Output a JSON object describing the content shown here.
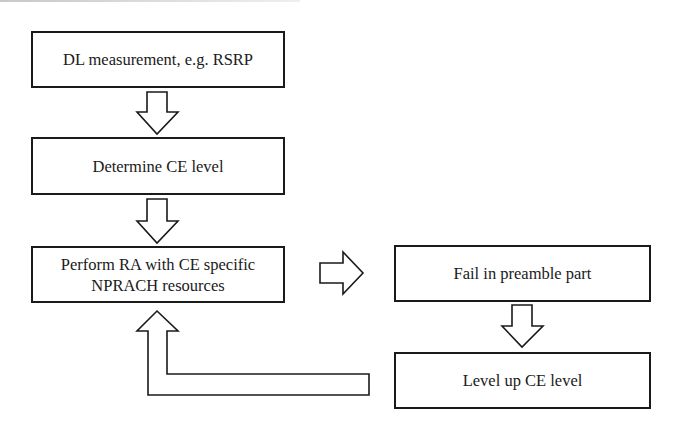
{
  "diagram": {
    "type": "flowchart",
    "nodes": [
      {
        "id": "dl-measurement",
        "label": "DL measurement, e.g. RSRP"
      },
      {
        "id": "determine-ce",
        "label": "Determine CE level"
      },
      {
        "id": "perform-ra",
        "label_line1": "Perform RA with CE specific",
        "label_line2": "NPRACH resources"
      },
      {
        "id": "fail-preamble",
        "label": "Fail in preamble part"
      },
      {
        "id": "level-up",
        "label": "Level up CE level"
      }
    ],
    "edges": [
      {
        "from": "dl-measurement",
        "to": "determine-ce"
      },
      {
        "from": "determine-ce",
        "to": "perform-ra"
      },
      {
        "from": "perform-ra",
        "to": "fail-preamble"
      },
      {
        "from": "fail-preamble",
        "to": "level-up"
      },
      {
        "from": "level-up",
        "to": "perform-ra"
      }
    ],
    "colors": {
      "stroke": "#1a1a1a",
      "fill": "#ffffff"
    }
  }
}
